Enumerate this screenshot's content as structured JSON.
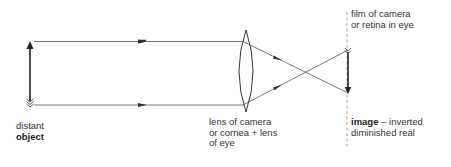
{
  "diagram": {
    "type": "optics-ray-diagram",
    "labels": {
      "object": {
        "line1": "distant",
        "line2": "object"
      },
      "lens": {
        "line1": "lens of camera",
        "line2": "or cornea + lens",
        "line3": "of eye"
      },
      "screen": {
        "line1": "film of camera",
        "line2": "or retina in eye"
      },
      "image": {
        "bold": "image",
        "rest": " – inverted",
        "line2": "diminished real"
      }
    },
    "elements": [
      {
        "id": "object-arrow",
        "kind": "upright-arrow",
        "label_ref": "object"
      },
      {
        "id": "ray-top",
        "kind": "ray",
        "from": "object-top",
        "to": "image-bottom",
        "via": "lens"
      },
      {
        "id": "ray-bottom",
        "kind": "ray",
        "from": "object-bottom",
        "to": "image-top",
        "via": "lens"
      },
      {
        "id": "convex-lens",
        "kind": "biconvex-lens",
        "label_ref": "lens"
      },
      {
        "id": "screen-line",
        "kind": "dashed-line",
        "label_ref": "screen"
      },
      {
        "id": "image-arrow",
        "kind": "inverted-arrow",
        "label_ref": "image"
      }
    ],
    "colors": {
      "line": "#333333",
      "ray": "#555555",
      "background": "#ffffff"
    }
  }
}
